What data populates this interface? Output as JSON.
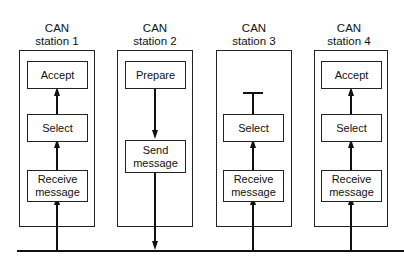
{
  "diagram": {
    "stations": [
      {
        "title_line1": "CAN",
        "title_line2": "station 1",
        "boxes": [
          "Accept",
          "Select",
          "Receive message"
        ],
        "flow": "up"
      },
      {
        "title_line1": "CAN",
        "title_line2": "station 2",
        "boxes": [
          "Prepare",
          "Send message"
        ],
        "flow": "down"
      },
      {
        "title_line1": "CAN",
        "title_line2": "station 3",
        "boxes": [
          "Select",
          "Receive message"
        ],
        "flow": "up-blocked"
      },
      {
        "title_line1": "CAN",
        "title_line2": "station 4",
        "boxes": [
          "Accept",
          "Select",
          "Receive message"
        ],
        "flow": "up"
      }
    ],
    "labels": {
      "s1_accept": "Accept",
      "s1_select": "Select",
      "s1_recv_1": "Receive",
      "s1_recv_2": "message",
      "s2_prepare": "Prepare",
      "s2_send_1": "Send",
      "s2_send_2": "message",
      "s3_select": "Select",
      "s3_recv_1": "Receive",
      "s3_recv_2": "message",
      "s4_accept": "Accept",
      "s4_select": "Select",
      "s4_recv_1": "Receive",
      "s4_recv_2": "message"
    },
    "bus": "CAN bus line"
  }
}
